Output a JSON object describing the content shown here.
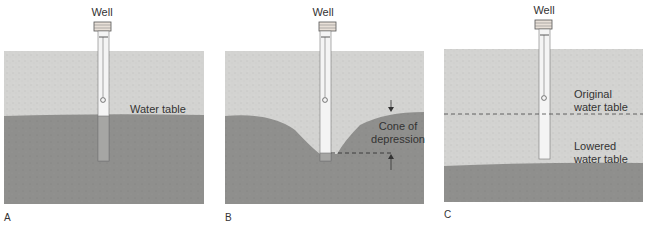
{
  "colors": {
    "dry_soil": "#d2d2d0",
    "saturated": "#8e8e8c",
    "well_pipe": "#f4f4f4",
    "outline": "#555555",
    "text": "#333333"
  },
  "panels": [
    {
      "id": "A",
      "letter": "A",
      "well_label": "Well",
      "labels": [
        "Water table"
      ]
    },
    {
      "id": "B",
      "letter": "B",
      "well_label": "Well",
      "labels": [
        "Cone of",
        "depression"
      ]
    },
    {
      "id": "C",
      "letter": "C",
      "well_label": "Well",
      "labels": [
        "Original",
        "water table",
        "Lowered",
        "water table"
      ]
    }
  ]
}
